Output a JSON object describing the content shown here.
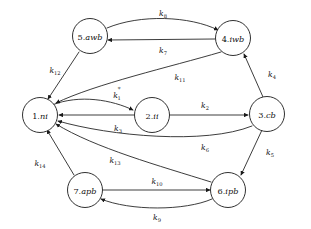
{
  "diagram": {
    "kind": "state-transition-graph",
    "title": "",
    "background_color": "#ffffff",
    "stroke_color": "#1a1a1a",
    "text_color": "#111111",
    "node_radius": 17.5,
    "nodes": [
      {
        "id": "n1",
        "label": "1.ni",
        "index": "1",
        "state": "ni",
        "cx": 40,
        "cy": 115
      },
      {
        "id": "n2",
        "label": "2.ii",
        "index": "2",
        "state": "ii",
        "cx": 152,
        "cy": 115
      },
      {
        "id": "n3",
        "label": "3.cb",
        "index": "3",
        "state": "cb",
        "cx": 267,
        "cy": 114
      },
      {
        "id": "n4",
        "label": "4.iwb",
        "index": "4",
        "state": "iwb",
        "cx": 233,
        "cy": 38
      },
      {
        "id": "n5",
        "label": "5.awb",
        "index": "5",
        "state": "awb",
        "cx": 90,
        "cy": 36
      },
      {
        "id": "n6",
        "label": "6.ipb",
        "index": "6",
        "state": "ipb",
        "cx": 228,
        "cy": 190
      },
      {
        "id": "n7",
        "label": "7.apb",
        "index": "7",
        "state": "apb",
        "cx": 85,
        "cy": 190
      }
    ],
    "edges": [
      {
        "id": "e8",
        "rate": "k",
        "sub": "8",
        "sup": "",
        "from": "n5",
        "to": "n4",
        "label_x": 163,
        "label_y": 13,
        "path": "M 107 28 C 140 14, 190 16, 218 30"
      },
      {
        "id": "e7",
        "rate": "k",
        "sub": "7",
        "sup": "",
        "from": "n4",
        "to": "n5",
        "label_x": 163,
        "label_y": 50,
        "path": "M 215 39 L 108 40"
      },
      {
        "id": "e12",
        "rate": "k",
        "sub": "12",
        "sup": "",
        "from": "n5",
        "to": "n1",
        "label_x": 55,
        "label_y": 70,
        "path": "M 79 52 L 48 99"
      },
      {
        "id": "e11",
        "rate": "k",
        "sub": "11",
        "sup": "",
        "from": "n4",
        "to": "n1",
        "label_x": 180,
        "label_y": 77,
        "path": "M 221 52 C 170 67, 95 84, 56 103"
      },
      {
        "id": "e4",
        "rate": "k",
        "sub": "4",
        "sup": "",
        "from": "n3",
        "to": "n4",
        "label_x": 272,
        "label_y": 74,
        "path": "M 263 97 L 244 54"
      },
      {
        "id": "e1",
        "rate": "k",
        "sub": "1",
        "sup": "*",
        "from": "n1",
        "to": "n2",
        "label_x": 117,
        "label_y": 95,
        "path": "M 52 105 C 80 94, 112 100, 133 110"
      },
      {
        "id": "e3",
        "rate": "k",
        "sub": "3",
        "sup": "",
        "from": "n2",
        "to": "n1",
        "label_x": 118,
        "label_y": 128,
        "path": "M 134 115 L 59 115"
      },
      {
        "id": "e2",
        "rate": "k",
        "sub": "2",
        "sup": "",
        "from": "n2",
        "to": "n3",
        "label_x": 205,
        "label_y": 105,
        "path": "M 170 115 L 248 115"
      },
      {
        "id": "e6",
        "rate": "k",
        "sub": "6",
        "sup": "",
        "from": "n3",
        "to": "n1",
        "label_x": 205,
        "label_y": 147,
        "path": "M 252 126 C 205 145, 110 136, 58 121"
      },
      {
        "id": "e5",
        "rate": "k",
        "sub": "5",
        "sup": "",
        "from": "n3",
        "to": "n6",
        "label_x": 270,
        "label_y": 152,
        "path": "M 262 130 L 241 175"
      },
      {
        "id": "e13",
        "rate": "k",
        "sub": "13",
        "sup": "",
        "from": "n6",
        "to": "n1",
        "label_x": 115,
        "label_y": 160,
        "path": "M 211 182 C 160 166, 95 148, 56 124"
      },
      {
        "id": "e14",
        "rate": "k",
        "sub": "14",
        "sup": "",
        "from": "n7",
        "to": "n1",
        "label_x": 40,
        "label_y": 163,
        "path": "M 74 175 L 47 130"
      },
      {
        "id": "e10",
        "rate": "k",
        "sub": "10",
        "sup": "",
        "from": "n7",
        "to": "n6",
        "label_x": 157,
        "label_y": 181,
        "path": "M 103 190 L 210 190"
      },
      {
        "id": "e9",
        "rate": "k",
        "sub": "9",
        "sup": "",
        "from": "n6",
        "to": "n7",
        "label_x": 157,
        "label_y": 217,
        "path": "M 212 199 C 185 211, 130 211, 101 199"
      }
    ]
  }
}
